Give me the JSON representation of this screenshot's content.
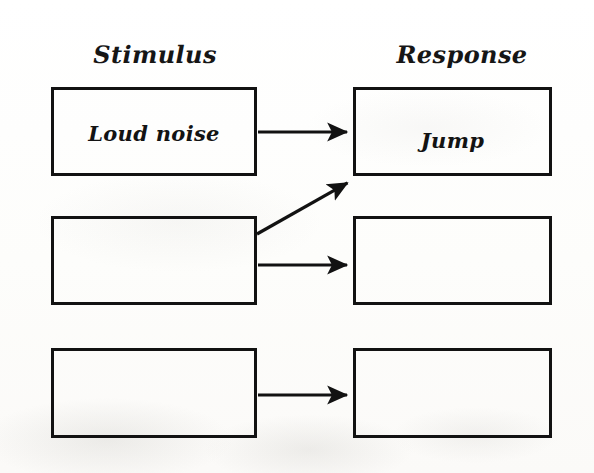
{
  "diagram": {
    "type": "stimulus-response-flow",
    "background_color": "#fdfdfc",
    "ink_color": "#121212",
    "headers": [
      {
        "id": "stimulus",
        "label": "Stimulus",
        "center_x": 155,
        "y": 57
      },
      {
        "id": "response",
        "label": "Response",
        "center_x": 462,
        "y": 57
      }
    ],
    "boxes": [
      {
        "id": "stimulus-1",
        "column": "stimulus",
        "row": 1,
        "label": "Loud noise",
        "x": 51,
        "y": 87,
        "w": 206,
        "h": 89,
        "empty": false
      },
      {
        "id": "response-1",
        "column": "response",
        "row": 1,
        "label": "Jump",
        "x": 353,
        "y": 87,
        "w": 199,
        "h": 89,
        "empty": false
      },
      {
        "id": "stimulus-2",
        "column": "stimulus",
        "row": 2,
        "label": "",
        "x": 51,
        "y": 216,
        "w": 206,
        "h": 89,
        "empty": true
      },
      {
        "id": "response-2",
        "column": "response",
        "row": 2,
        "label": "",
        "x": 353,
        "y": 216,
        "w": 199,
        "h": 89,
        "empty": true
      },
      {
        "id": "stimulus-3",
        "column": "stimulus",
        "row": 3,
        "label": "",
        "x": 51,
        "y": 348,
        "w": 206,
        "h": 90,
        "empty": true
      },
      {
        "id": "response-3",
        "column": "response",
        "row": 3,
        "label": "",
        "x": 353,
        "y": 348,
        "w": 199,
        "h": 90,
        "empty": true
      }
    ],
    "arrows": [
      {
        "id": "arrow-stimulus1-to-response1",
        "kind": "horizontal",
        "from": "stimulus-1",
        "to": "response-1",
        "x1": 258,
        "y1": 132,
        "x2": 352,
        "y2": 132
      },
      {
        "id": "arrow-stimulus2-to-response1",
        "kind": "diagonal",
        "from": "stimulus-2",
        "to": "response-1",
        "x1": 257,
        "y1": 234,
        "x2": 352,
        "y2": 180
      },
      {
        "id": "arrow-stimulus2-to-response2",
        "kind": "horizontal",
        "from": "stimulus-2",
        "to": "response-2",
        "x1": 258,
        "y1": 265,
        "x2": 352,
        "y2": 265
      },
      {
        "id": "arrow-stimulus3-to-response3",
        "kind": "horizontal",
        "from": "stimulus-3",
        "to": "response-3",
        "x1": 258,
        "y1": 395,
        "x2": 352,
        "y2": 395
      }
    ]
  }
}
